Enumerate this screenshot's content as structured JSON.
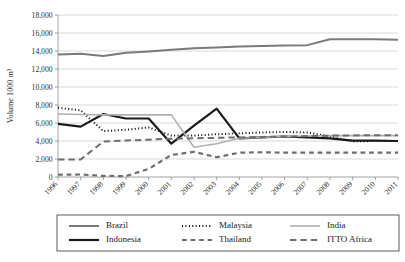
{
  "chart_data": {
    "type": "line",
    "title": "",
    "xlabel": "",
    "ylabel": "Volume 1000 m³",
    "ylim": [
      0,
      18000
    ],
    "ytick_labels": [
      "0",
      "2,000",
      "4,000",
      "6,000",
      "8,000",
      "10,000",
      "12,000",
      "14,000",
      "16,000",
      "18,000"
    ],
    "ytick_values": [
      0,
      2000,
      4000,
      6000,
      8000,
      10000,
      12000,
      14000,
      16000,
      18000
    ],
    "grid": true,
    "legend_position": "bottom",
    "categories": [
      "1996",
      "1997",
      "1998",
      "1999",
      "2000",
      "2001",
      "2002",
      "2003",
      "2004",
      "2005",
      "2006",
      "2007",
      "2008",
      "2009",
      "2010",
      "2011"
    ],
    "x": [
      1996,
      1997,
      1998,
      1999,
      2000,
      2001,
      2002,
      2003,
      2004,
      2005,
      2006,
      2007,
      2008,
      2009,
      2010,
      2011
    ],
    "series": [
      {
        "name": "Brazil",
        "style": "solid",
        "color": "#7a7a7a",
        "width": 2.0,
        "values": [
          13600,
          13700,
          13450,
          13800,
          13950,
          14150,
          14300,
          14400,
          14500,
          14550,
          14600,
          14650,
          15300,
          15300,
          15300,
          15250
        ]
      },
      {
        "name": "Indonesia",
        "style": "solid",
        "color": "#1a1a1a",
        "width": 2.2,
        "values": [
          5900,
          5600,
          7000,
          6500,
          6500,
          3700,
          5700,
          7600,
          4300,
          4400,
          4500,
          4400,
          4300,
          4050,
          4050,
          4000
        ]
      },
      {
        "name": "Malaysia",
        "style": "dotted",
        "color": "#1a1a1a",
        "width": 2.0,
        "values": [
          7700,
          7400,
          5100,
          5250,
          5500,
          4600,
          4600,
          4750,
          4850,
          4950,
          5000,
          4950,
          4500,
          3950,
          4000,
          4000
        ]
      },
      {
        "name": "Thailand",
        "style": "dashed-short",
        "color": "#6e6e6e",
        "width": 2.2,
        "values": [
          250,
          280,
          120,
          100,
          900,
          2450,
          2800,
          2200,
          2700,
          2750,
          2700,
          2700,
          2700,
          2700,
          2700,
          2700
        ]
      },
      {
        "name": "India",
        "style": "solid",
        "color": "#b0b0b0",
        "width": 1.6,
        "values": [
          7000,
          6950,
          6900,
          6900,
          6900,
          6900,
          3300,
          3700,
          4300,
          4400,
          4500,
          4550,
          4600,
          4600,
          4600,
          4600
        ]
      },
      {
        "name": "ITTO Africa",
        "style": "dashed-long",
        "color": "#6e6e6e",
        "width": 2.0,
        "values": [
          1950,
          1950,
          3950,
          4050,
          4150,
          4250,
          4300,
          4350,
          4400,
          4450,
          4500,
          4550,
          4600,
          4620,
          4650,
          4650
        ]
      }
    ],
    "legend": [
      {
        "label": "Brazil",
        "style": "solid",
        "color": "#7a7a7a",
        "width": 2.0
      },
      {
        "label": "Malaysia",
        "style": "dotted",
        "color": "#1a1a1a",
        "width": 2.0
      },
      {
        "label": "India",
        "style": "solid",
        "color": "#b0b0b0",
        "width": 1.6
      },
      {
        "label": "Indonesia",
        "style": "solid",
        "color": "#1a1a1a",
        "width": 2.2
      },
      {
        "label": "Thailand",
        "style": "dashed-short",
        "color": "#6e6e6e",
        "width": 2.2
      },
      {
        "label": "ITTO Africa",
        "style": "dashed-long",
        "color": "#6e6e6e",
        "width": 2.0
      }
    ]
  },
  "layout": {
    "plot_left": 58,
    "plot_right": 398,
    "plot_top": 15,
    "plot_bottom": 177,
    "legend_box": {
      "x": 57,
      "y": 215,
      "w": 342,
      "h": 36
    }
  }
}
